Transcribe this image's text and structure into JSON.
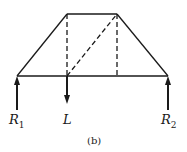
{
  "diagram": {
    "type": "truss",
    "labels": {
      "r1_main": "R",
      "r1_sub": "1",
      "load": "L",
      "r2_main": "R",
      "r2_sub": "2"
    },
    "caption": "(b)",
    "color": "#1a1a1a"
  }
}
